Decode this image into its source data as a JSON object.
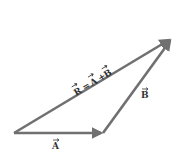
{
  "diagram": {
    "colors": {
      "vector": "#707070",
      "label": "#333333",
      "background": "#ffffff"
    },
    "vectors": [
      {
        "name": "A",
        "label": "A",
        "from": [
          14,
          133
        ],
        "to": [
          103,
          133
        ]
      },
      {
        "name": "B",
        "label": "B",
        "from": [
          103,
          133
        ],
        "to": [
          172,
          38
        ]
      },
      {
        "name": "R",
        "label": "R = A + B",
        "from": [
          14,
          133
        ],
        "to": [
          172,
          38
        ]
      }
    ],
    "labels": {
      "A": "A",
      "B": "B",
      "R_eq": {
        "R": "R",
        "eq": "=",
        "A": "A",
        "plus": "+",
        "B": "B"
      }
    }
  }
}
